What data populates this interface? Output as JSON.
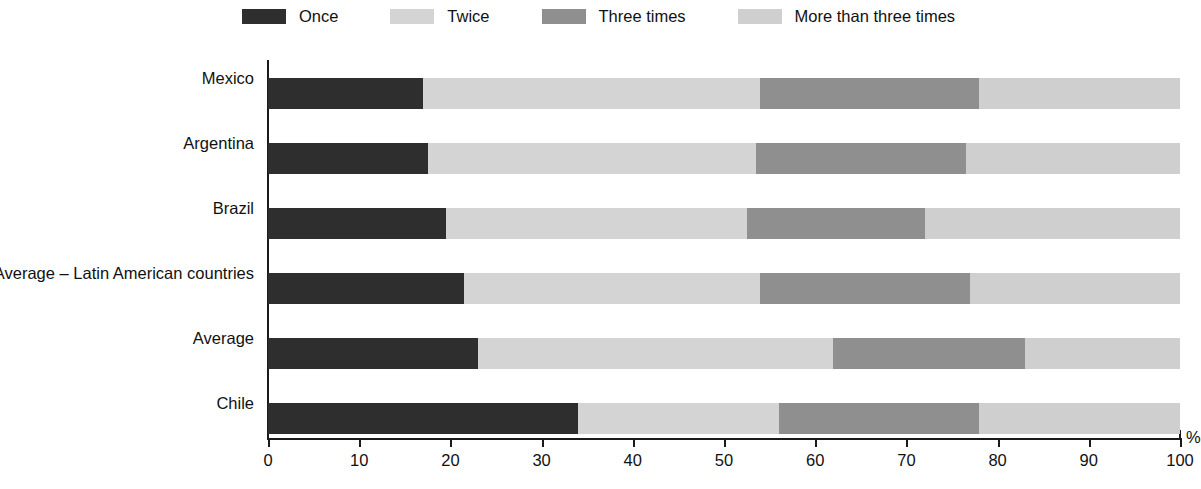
{
  "chart_data": {
    "type": "bar",
    "orientation": "horizontal",
    "stacked": true,
    "title": "",
    "subtitle": "",
    "xlabel": "%",
    "ylabel": "",
    "xlim": [
      0,
      100
    ],
    "xticks": [
      0,
      10,
      20,
      30,
      40,
      50,
      60,
      70,
      80,
      90,
      100
    ],
    "grid": false,
    "legend_position": "top-center",
    "categories": [
      "Mexico",
      "Argentina",
      "Brazil",
      "Average – Latin American countries",
      "Average",
      "Chile"
    ],
    "series": [
      {
        "name": "Once",
        "color": "#2e2e2e",
        "values": [
          17.0,
          17.5,
          19.5,
          21.5,
          23.0,
          34.0
        ]
      },
      {
        "name": "Twice",
        "color": "#d4d4d4",
        "values": [
          37.0,
          36.0,
          33.0,
          32.5,
          39.0,
          22.0
        ]
      },
      {
        "name": "Three times",
        "color": "#8f8f8f",
        "values": [
          24.0,
          23.0,
          19.5,
          23.0,
          21.0,
          22.0
        ]
      },
      {
        "name": "More than three times",
        "color": "#cfcfcf",
        "values": [
          22.0,
          23.5,
          28.0,
          23.0,
          17.0,
          22.0
        ]
      }
    ]
  },
  "legend": {
    "items": [
      {
        "label": "Once",
        "color": "#2e2e2e"
      },
      {
        "label": "Twice",
        "color": "#d4d4d4"
      },
      {
        "label": "Three times",
        "color": "#8f8f8f"
      },
      {
        "label": "More than three times",
        "color": "#cfcfcf"
      }
    ]
  },
  "axis": {
    "unit": "%",
    "ticks": [
      "0",
      "10",
      "20",
      "30",
      "40",
      "50",
      "60",
      "70",
      "80",
      "90",
      "100"
    ]
  }
}
